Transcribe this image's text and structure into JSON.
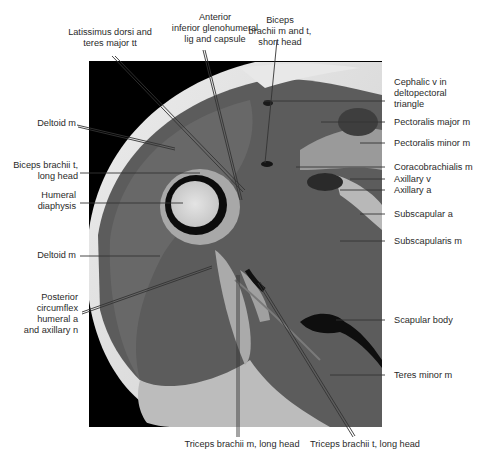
{
  "figure": {
    "type": "axial MRI cross-section of shoulder / proximal arm",
    "colors": {
      "background": "#ffffff",
      "image_bg": "#000000",
      "muscle": "#5a5a5a",
      "fat": "#d8d8d8",
      "bone_marrow": "#d6d6d6",
      "cortex": "#101010",
      "label_text": "#2a2a2a",
      "leader_line": "#333333"
    }
  },
  "labels": {
    "top": [
      {
        "id": "latissimus",
        "lines": [
          "Latissimus dorsi and",
          "teres major tt"
        ]
      },
      {
        "id": "glenohumeral",
        "lines": [
          "Anterior",
          "inferior glenohumeral",
          "lig and capsule"
        ]
      },
      {
        "id": "biceps_short",
        "lines": [
          "Biceps",
          "brachii m and t,",
          "short head"
        ]
      }
    ],
    "left": [
      {
        "id": "deltoid_upper",
        "lines": [
          "Deltoid m"
        ]
      },
      {
        "id": "biceps_long",
        "lines": [
          "Biceps brachii t,",
          "long head"
        ]
      },
      {
        "id": "humeral",
        "lines": [
          "Humeral",
          "diaphysis"
        ]
      },
      {
        "id": "deltoid_lower",
        "lines": [
          "Deltoid m"
        ]
      },
      {
        "id": "posterior_circumflex",
        "lines": [
          "Posterior",
          "circumflex",
          "humeral a",
          "and axillary n"
        ]
      }
    ],
    "right": [
      {
        "id": "cephalic",
        "lines": [
          "Cephalic v in",
          "deltopectoral",
          "triangle"
        ]
      },
      {
        "id": "pec_major",
        "lines": [
          "Pectoralis major m"
        ]
      },
      {
        "id": "pec_minor",
        "lines": [
          "Pectoralis minor m"
        ]
      },
      {
        "id": "coracobrachialis",
        "lines": [
          "Coracobrachialis m"
        ]
      },
      {
        "id": "axillary_v",
        "lines": [
          "Axillary v"
        ]
      },
      {
        "id": "axillary_a",
        "lines": [
          "Axillary a"
        ]
      },
      {
        "id": "subscapular_a",
        "lines": [
          "Subscapular a"
        ]
      },
      {
        "id": "subscapularis",
        "lines": [
          "Subscapularis m"
        ]
      },
      {
        "id": "scapular_body",
        "lines": [
          "Scapular body"
        ]
      },
      {
        "id": "teres_minor",
        "lines": [
          "Teres minor m"
        ]
      }
    ],
    "bottom": [
      {
        "id": "triceps_m",
        "lines": [
          "Triceps brachii m, long head"
        ]
      },
      {
        "id": "triceps_t",
        "lines": [
          "Triceps brachii t, long head"
        ]
      }
    ]
  }
}
